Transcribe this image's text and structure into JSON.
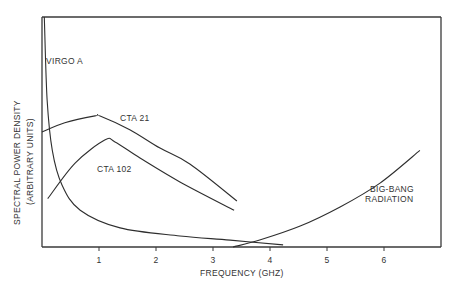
{
  "chart_data": {
    "type": "line",
    "title": "",
    "xlabel": "FREQUENCY (GHZ)",
    "ylabel_line1": "SPECTRAL POWER DENSITY",
    "ylabel_line2": "(ARBITRARY UNITS)",
    "xlim": [
      0,
      7
    ],
    "ylim": [
      0,
      10
    ],
    "grid": false,
    "legend": "none",
    "x_ticks": [
      1,
      2,
      3,
      4,
      5,
      6
    ],
    "x_tick_labels": [
      "1",
      "2",
      "3",
      "4",
      "5",
      "6"
    ],
    "series": [
      {
        "name": "VIRGO A",
        "label": "VIRGO A",
        "x": [
          0.04,
          0.09,
          0.18,
          0.35,
          0.67,
          1.37,
          2.42,
          3.3,
          4.23
        ],
        "y": [
          10,
          6.4,
          4.2,
          2.7,
          1.6,
          0.83,
          0.48,
          0.3,
          0.09
        ]
      },
      {
        "name": "CTA 21",
        "label": "CTA 21",
        "x": [
          0,
          0.4,
          0.93,
          1.02,
          1.54,
          2.07,
          2.6,
          3.42
        ],
        "y": [
          5.0,
          5.4,
          5.7,
          5.7,
          5.1,
          4.3,
          3.6,
          2.0
        ]
      },
      {
        "name": "CTA 102",
        "label": "CTA 102",
        "x": [
          0.1,
          0.58,
          1.1,
          1.28,
          1.72,
          2.42,
          3.37
        ],
        "y": [
          2.1,
          3.65,
          4.65,
          4.57,
          3.87,
          2.83,
          1.6
        ]
      },
      {
        "name": "BIG-BANG RADIATION",
        "label_line1": "BIG-BANG",
        "label_line2": "RADIATION",
        "x": [
          3.35,
          3.82,
          4.53,
          5.23,
          5.93,
          6.63
        ],
        "y": [
          0,
          0.3,
          0.91,
          1.74,
          2.78,
          4.2
        ]
      }
    ]
  }
}
